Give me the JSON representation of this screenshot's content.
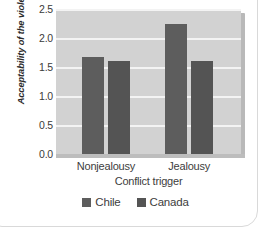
{
  "chart_data": {
    "type": "bar",
    "title": "",
    "subtitle": "",
    "xlabel": "Conflict trigger",
    "ylabel": "Acceptability of the violence",
    "categories": [
      "Nonjealousy",
      "Jealousy"
    ],
    "series": [
      {
        "name": "Chile",
        "color": "#5d5d5d",
        "values": [
          1.68,
          2.25
        ]
      },
      {
        "name": "Canada",
        "color": "#545454",
        "values": [
          1.61,
          1.61
        ]
      }
    ],
    "ylim": [
      0.0,
      2.5
    ],
    "ytick_labels": [
      "0.0",
      "0.5",
      "1.0",
      "1.5",
      "2.0",
      "2.5"
    ],
    "ytick_values": [
      0.0,
      0.5,
      1.0,
      1.5,
      2.0,
      2.5
    ],
    "grid": true,
    "grid_color": "#f3f3f3",
    "plot_background": "#d2d2d2",
    "legend_position": "bottom",
    "legend_entries": [
      "Chile",
      "Canada"
    ]
  },
  "figure": {
    "background": "#ffffff",
    "axis_text_color": "#3d3d3d"
  }
}
